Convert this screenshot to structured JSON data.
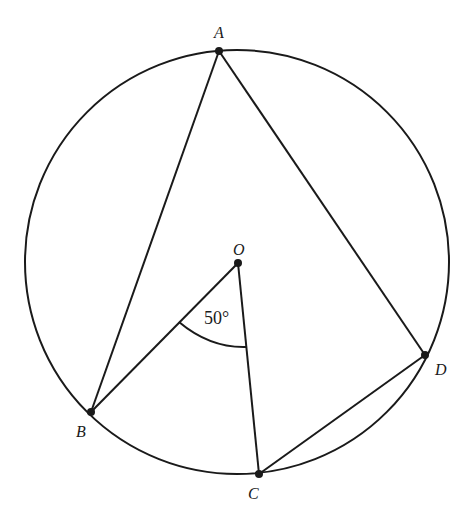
{
  "diagram": {
    "type": "circle-geometry",
    "circle": {
      "center_label": "O",
      "cx": 237,
      "cy": 262,
      "r": 212
    },
    "points": [
      {
        "id": "A",
        "label": "A",
        "x": 219,
        "y": 51,
        "label_dx": -3,
        "label_dy": -12
      },
      {
        "id": "B",
        "label": "B",
        "x": 91,
        "y": 412,
        "label_dx": -14,
        "label_dy": 24
      },
      {
        "id": "C",
        "label": "C",
        "x": 259,
        "y": 474,
        "label_dx": -10,
        "label_dy": 25
      },
      {
        "id": "D",
        "label": "D",
        "x": 425,
        "y": 355,
        "label_dx": 10,
        "label_dy": 20
      },
      {
        "id": "O",
        "label": "O",
        "x": 238,
        "y": 263,
        "label_dx": -5,
        "label_dy": -8
      }
    ],
    "segments": [
      [
        "A",
        "B"
      ],
      [
        "A",
        "D"
      ],
      [
        "O",
        "B"
      ],
      [
        "O",
        "C"
      ],
      [
        "C",
        "D"
      ]
    ],
    "angle_marker": {
      "vertex": "O",
      "label": "50°",
      "arc_radius": 84
    },
    "stroke_color": "#1a1a1a"
  }
}
